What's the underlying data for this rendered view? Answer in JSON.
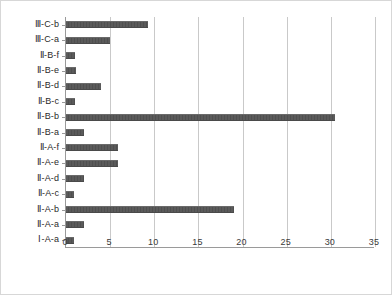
{
  "chart_data": {
    "type": "bar",
    "orientation": "horizontal",
    "title": "",
    "xlabel": "",
    "ylabel": "",
    "xlim": [
      0,
      35
    ],
    "xticks": [
      0,
      5,
      10,
      15,
      20,
      25,
      30,
      35
    ],
    "grid": true,
    "legend": "none",
    "bar_color": "#595959",
    "categories": [
      "Ⅲ-C-b",
      "Ⅲ-C-a",
      "Ⅱ-B-f",
      "Ⅱ-B-e",
      "Ⅱ-B-d",
      "Ⅱ-B-c",
      "Ⅱ-B-b",
      "Ⅱ-B-a",
      "Ⅱ-A-f",
      "Ⅱ-A-e",
      "Ⅱ-A-d",
      "Ⅱ-A-c",
      "Ⅱ-A-b",
      "Ⅱ-A-a",
      "Ⅰ-A-a"
    ],
    "values": [
      9.3,
      5.0,
      1.0,
      1.1,
      4.0,
      1.0,
      30.5,
      2.0,
      5.9,
      5.9,
      2.0,
      0.9,
      19.0,
      2.0,
      0.9
    ]
  }
}
